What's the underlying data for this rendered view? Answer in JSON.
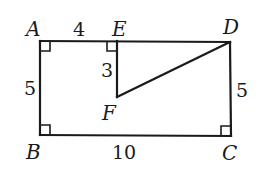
{
  "diagram": {
    "type": "geometry",
    "points": {
      "A": {
        "label": "A",
        "x": 40,
        "y": 41
      },
      "B": {
        "label": "B",
        "x": 40,
        "y": 135
      },
      "C": {
        "label": "C",
        "x": 231,
        "y": 136
      },
      "D": {
        "label": "D",
        "x": 230,
        "y": 42
      },
      "E": {
        "label": "E",
        "x": 117,
        "y": 41
      },
      "F": {
        "label": "F",
        "x": 117,
        "y": 97
      }
    },
    "segments": [
      {
        "from": "A",
        "to": "D"
      },
      {
        "from": "A",
        "to": "B"
      },
      {
        "from": "B",
        "to": "C"
      },
      {
        "from": "C",
        "to": "D"
      },
      {
        "from": "E",
        "to": "F"
      },
      {
        "from": "F",
        "to": "D"
      }
    ],
    "right_angles": [
      "A",
      "E",
      "B",
      "C"
    ],
    "lengths": {
      "AE": "4",
      "AB": "5",
      "EF": "3",
      "BC": "10",
      "CD": "5"
    }
  }
}
